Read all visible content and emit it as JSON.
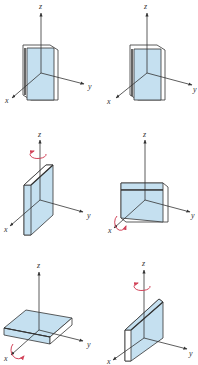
{
  "figure": {
    "colors": {
      "plate_face": "#c5e0f0",
      "plate_edge": "#ffffff",
      "outline": "#333333",
      "axis": "#333333",
      "rotation_arrow": "#d2445a"
    },
    "panels": [
      {
        "id": "p1",
        "row": 1,
        "col": 1,
        "labels": {
          "x": "x",
          "y": "y",
          "z": "z"
        },
        "rotation": "none",
        "orientation": "upright in x-z plane"
      },
      {
        "id": "p2",
        "row": 1,
        "col": 2,
        "labels": {
          "x": "x",
          "y": "y",
          "z": "z"
        },
        "rotation": "none",
        "orientation": "upright in x-z plane"
      },
      {
        "id": "p3",
        "row": 2,
        "col": 1,
        "labels": {
          "x": "x",
          "y": "y",
          "z": "z"
        },
        "rotation": "z",
        "orientation": "upright in y-z plane"
      },
      {
        "id": "p4",
        "row": 2,
        "col": 2,
        "labels": {
          "x": "x",
          "y": "y",
          "z": "z"
        },
        "rotation": "x",
        "orientation": "upright wide in y-z plane"
      },
      {
        "id": "p5",
        "row": 3,
        "col": 1,
        "labels": {
          "x": "x",
          "y": "y",
          "z": "z"
        },
        "rotation": "x",
        "orientation": "flat in x-y plane"
      },
      {
        "id": "p6",
        "row": 3,
        "col": 2,
        "labels": {
          "x": "x",
          "y": "y",
          "z": "z"
        },
        "rotation": "z",
        "orientation": "upright in x-z plane, rotated"
      }
    ]
  }
}
